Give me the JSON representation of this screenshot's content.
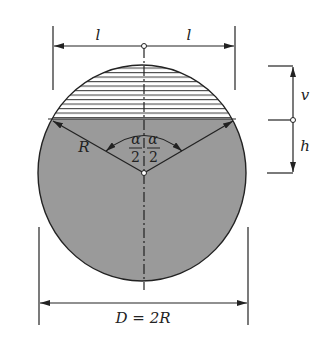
{
  "figure": {
    "colors": {
      "fill": "#9a9a9a",
      "stroke": "#222222",
      "hatch": "#333333",
      "background": "#ffffff"
    },
    "labels": {
      "half_width_left": "l",
      "half_width_right": "l",
      "radius": "R",
      "angle_numerator": "α",
      "angle_denominator": "2",
      "upper_height": "v",
      "lower_height": "h",
      "diameter": "D = 2R"
    }
  }
}
